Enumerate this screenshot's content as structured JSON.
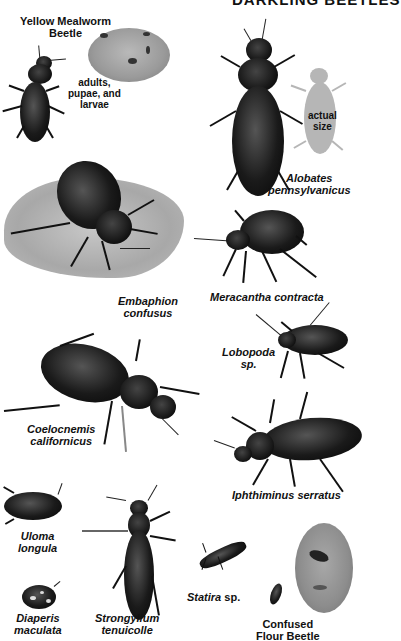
{
  "title": "DARKLING BEETLES",
  "specimens": [
    {
      "id": "yellow-mealworm-beetle",
      "label_line1": "Yellow Mealworm",
      "label_line2": "Beetle"
    },
    {
      "id": "mealworm-inset",
      "label_line1": "adults,",
      "label_line2": "pupae, and",
      "label_line3": "larvae"
    },
    {
      "id": "alobates",
      "label_line1": "Alobates",
      "label_line2": "pennsylvanicus"
    },
    {
      "id": "actual-size",
      "label_line1": "actual",
      "label_line2": "size"
    },
    {
      "id": "embaphion",
      "label_line1": "Embaphion",
      "label_line2": "confusus"
    },
    {
      "id": "meracantha",
      "label_line1": "Meracantha contracta"
    },
    {
      "id": "lobopoda",
      "label_line1": "Lobopoda",
      "label_line2": "sp."
    },
    {
      "id": "coelocnemis",
      "label_line1": "Coelocnemis",
      "label_line2": "californicus"
    },
    {
      "id": "iphthiminus",
      "label_line1": "Iphthiminus serratus"
    },
    {
      "id": "uloma",
      "label_line1": "Uloma",
      "label_line2": "longula"
    },
    {
      "id": "diaperis",
      "label_line1": "Diaperis",
      "label_line2": "maculata"
    },
    {
      "id": "strongylium",
      "label_line1": "Strongylium",
      "label_line2": "tenuicolle"
    },
    {
      "id": "statira",
      "label_genus": "Statira",
      "label_suffix": " sp."
    },
    {
      "id": "confused-flour-beetle",
      "label_line1": "Confused",
      "label_line2": "Flour Beetle"
    }
  ],
  "colors": {
    "beetle": "#111111",
    "inset": "#9a9a9a",
    "actual_size_silhouette": "#b6b6b6",
    "text": "#111111",
    "background": "#ffffff"
  }
}
